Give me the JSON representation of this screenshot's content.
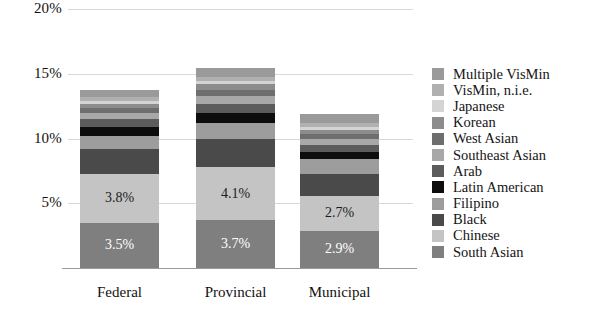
{
  "chart_data": {
    "type": "bar",
    "subtype": "stacked-bar",
    "title": "",
    "xlabel": "",
    "ylabel": "",
    "ylim": [
      0,
      20
    ],
    "ytick_labels": [
      "20%",
      "15%",
      "10%",
      "5%"
    ],
    "ytick_values": [
      20,
      15,
      10,
      5
    ],
    "grid": true,
    "grid_axis": "y",
    "legend_position": "right",
    "categories": [
      "Federal",
      "Provincial",
      "Municipal"
    ],
    "series": [
      {
        "name": "South Asian",
        "color": "#7f7f7f",
        "values": [
          3.5,
          3.7,
          2.9
        ],
        "labels": [
          "3.5%",
          "3.7%",
          "2.9%"
        ]
      },
      {
        "name": "Chinese",
        "color": "#c4c4c4",
        "values": [
          3.8,
          4.1,
          2.7
        ],
        "labels": [
          "3.8%",
          "4.1%",
          "2.7%"
        ]
      },
      {
        "name": "Black",
        "color": "#4a4a4a",
        "values": [
          1.9,
          2.2,
          1.7
        ],
        "labels": [
          "",
          "",
          ""
        ]
      },
      {
        "name": "Filipino",
        "color": "#9d9d9d",
        "values": [
          1.0,
          1.2,
          1.1
        ],
        "labels": [
          "",
          "",
          ""
        ]
      },
      {
        "name": "Latin American",
        "color": "#0d0d0d",
        "values": [
          0.7,
          0.8,
          0.6
        ],
        "labels": [
          "",
          "",
          ""
        ]
      },
      {
        "name": "Arab",
        "color": "#5c5c5c",
        "values": [
          0.6,
          0.7,
          0.5
        ],
        "labels": [
          "",
          "",
          ""
        ]
      },
      {
        "name": "Southeast Asian",
        "color": "#a8a8a8",
        "values": [
          0.5,
          0.6,
          0.5
        ],
        "labels": [
          "",
          "",
          ""
        ]
      },
      {
        "name": "West Asian",
        "color": "#6e6e6e",
        "values": [
          0.4,
          0.5,
          0.4
        ],
        "labels": [
          "",
          "",
          ""
        ]
      },
      {
        "name": "Korean",
        "color": "#8c8c8c",
        "values": [
          0.3,
          0.4,
          0.3
        ],
        "labels": [
          "",
          "",
          ""
        ]
      },
      {
        "name": "Japanese",
        "color": "#d4d4d4",
        "values": [
          0.2,
          0.3,
          0.2
        ],
        "labels": [
          "",
          "",
          ""
        ]
      },
      {
        "name": "VisMin, n.i.e.",
        "color": "#b0b0b0",
        "values": [
          0.3,
          0.3,
          0.3
        ],
        "labels": [
          "",
          "",
          ""
        ]
      },
      {
        "name": "Multiple VisMin",
        "color": "#9a9a9a",
        "values": [
          0.6,
          0.7,
          0.7
        ],
        "labels": [
          "",
          "",
          ""
        ]
      }
    ],
    "totals": [
      13.8,
      15.5,
      11.9
    ],
    "legend_entries": [
      "Multiple VisMin",
      "VisMin, n.i.e.",
      "Japanese",
      "Korean",
      "West Asian",
      "Southeast Asian",
      "Arab",
      "Latin American",
      "Filipino",
      "Black",
      "Chinese",
      "South Asian"
    ],
    "legend_colors": [
      "#9a9a9a",
      "#b0b0b0",
      "#d4d4d4",
      "#8c8c8c",
      "#6e6e6e",
      "#a8a8a8",
      "#5c5c5c",
      "#0d0d0d",
      "#9d9d9d",
      "#4a4a4a",
      "#c4c4c4",
      "#7f7f7f"
    ]
  }
}
